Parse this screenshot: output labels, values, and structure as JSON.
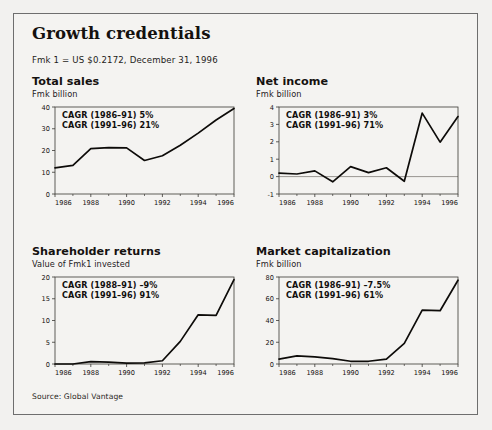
{
  "report": {
    "title": "Growth credentials",
    "subtitle": "Fmk 1 = US $0.2172, December 31, 1996",
    "source": "Source: Global Vantage"
  },
  "chart_data": [
    {
      "type": "line",
      "id": "total-sales",
      "title": "Total sales",
      "ylabel": "Fmk billion",
      "xlabel": "",
      "x": [
        1986,
        1987,
        1988,
        1989,
        1990,
        1991,
        1992,
        1993,
        1994,
        1995,
        1996
      ],
      "values": [
        12.0,
        13.2,
        20.9,
        21.3,
        21.2,
        15.4,
        17.6,
        22.4,
        28.0,
        34.0,
        39.3
      ],
      "xlim": [
        1986,
        1996
      ],
      "ylim": [
        0,
        40
      ],
      "yticks": [
        0,
        10,
        20,
        30,
        40
      ],
      "ytick_labels": [
        "0",
        "10",
        "20",
        "30",
        "40"
      ],
      "xticks": [
        1986,
        1988,
        1990,
        1992,
        1994,
        1996
      ],
      "xtick_labels": [
        "1986",
        "1988",
        "1990",
        "1992",
        "1994",
        "1996"
      ],
      "grid": false,
      "zero_line": false,
      "annotations": [
        "CAGR (1986–91) 5%",
        "CAGR (1991–96) 21%"
      ]
    },
    {
      "type": "line",
      "id": "net-income",
      "title": "Net income",
      "ylabel": "Fmk billion",
      "xlabel": "",
      "x": [
        1986,
        1987,
        1988,
        1989,
        1990,
        1991,
        1992,
        1993,
        1994,
        1995,
        1996
      ],
      "values": [
        0.2,
        0.15,
        0.33,
        -0.3,
        0.57,
        0.23,
        0.51,
        -0.27,
        3.65,
        1.98,
        3.45
      ],
      "xlim": [
        1986,
        1996
      ],
      "ylim": [
        -1,
        4
      ],
      "yticks": [
        -1,
        0,
        1,
        2,
        3,
        4
      ],
      "ytick_labels": [
        "-1",
        "0",
        "1",
        "2",
        "3",
        "4"
      ],
      "xticks": [
        1986,
        1988,
        1990,
        1992,
        1994,
        1996
      ],
      "xtick_labels": [
        "1986",
        "1988",
        "1990",
        "1992",
        "1994",
        "1996"
      ],
      "grid": false,
      "zero_line": true,
      "annotations": [
        "CAGR (1986–91) 3%",
        "CAGR (1991–96) 71%"
      ]
    },
    {
      "type": "line",
      "id": "shareholder-returns",
      "title": "Shareholder returns",
      "ylabel": "Value of Fmk1 invested",
      "xlabel": "",
      "x": [
        1986,
        1987,
        1988,
        1989,
        1990,
        1991,
        1992,
        1993,
        1994,
        1995,
        1996
      ],
      "values": [
        0.0,
        0.0,
        0.55,
        0.42,
        0.2,
        0.25,
        0.75,
        5.2,
        11.3,
        11.2,
        19.4
      ],
      "xlim": [
        1986,
        1996
      ],
      "ylim": [
        0,
        20
      ],
      "yticks": [
        0,
        5,
        10,
        15,
        20
      ],
      "ytick_labels": [
        "0",
        "5",
        "10",
        "15",
        "20"
      ],
      "xticks": [
        1986,
        1988,
        1990,
        1992,
        1994,
        1996
      ],
      "xtick_labels": [
        "1986",
        "1988",
        "1990",
        "1992",
        "1994",
        "1996"
      ],
      "grid": false,
      "zero_line": false,
      "annotations": [
        "CAGR (1988–91) –9%",
        "CAGR (1991–96) 91%"
      ]
    },
    {
      "type": "line",
      "id": "market-capitalization",
      "title": "Market capitalization",
      "ylabel": "Fmk billion",
      "xlabel": "",
      "x": [
        1986,
        1987,
        1988,
        1989,
        1990,
        1991,
        1992,
        1993,
        1994,
        1995,
        1996
      ],
      "values": [
        4.5,
        7.5,
        6.5,
        5.0,
        2.5,
        2.5,
        4.5,
        19.0,
        49.5,
        49.0,
        77.0
      ],
      "xlim": [
        1986,
        1996
      ],
      "ylim": [
        0,
        80
      ],
      "yticks": [
        0,
        20,
        40,
        60,
        80
      ],
      "ytick_labels": [
        "0",
        "20",
        "40",
        "60",
        "80"
      ],
      "xticks": [
        1986,
        1988,
        1990,
        1992,
        1994,
        1996
      ],
      "xtick_labels": [
        "1986",
        "1988",
        "1990",
        "1992",
        "1994",
        "1996"
      ],
      "grid": false,
      "zero_line": false,
      "annotations": [
        "CAGR (1986–91) –7.5%",
        "CAGR (1991–96) 61%"
      ]
    }
  ],
  "style": {
    "line_color": "#0d0b09",
    "axis_color": "#3a3734",
    "zero_line_color": "#8d8a86",
    "panel_bg": "#f4f3f1",
    "text_color": "#14110f"
  }
}
